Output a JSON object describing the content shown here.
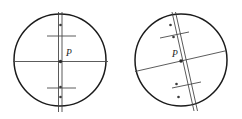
{
  "figure": {
    "kind": "reticle-comparison-diagram",
    "canvas": {
      "width": 242,
      "height": 119,
      "background": "#ffffff"
    },
    "colors": {
      "circle_stroke": "#1b1b1b",
      "reticle_stroke": "#4a4a4a",
      "tick_stroke": "#4a4a4a",
      "dot_fill": "#3a3a3a",
      "label_fill": "#1b1b1b"
    }
  },
  "panels": [
    {
      "id": "left-panel",
      "name": "aligned-reticle",
      "circle": {
        "cx": 60,
        "cy": 60,
        "r": 46
      },
      "rotation_deg": 0,
      "point": {
        "label": "P",
        "cx": 60.5,
        "cy": 61.5,
        "r": 1.7,
        "label_x": 66,
        "label_y": 56
      },
      "lines": [
        {
          "name": "horizontal-reticle-line",
          "x1": 13,
          "y1": 61.5,
          "x2": 108,
          "y2": 61.5
        },
        {
          "name": "vertical-reticle-line-a",
          "x1": 58.5,
          "y1": 12,
          "x2": 58.5,
          "y2": 112
        },
        {
          "name": "vertical-reticle-line-b",
          "x1": 62.0,
          "y1": 12,
          "x2": 62.0,
          "y2": 112
        }
      ],
      "ticks": [
        {
          "name": "upper-tick",
          "x1": 47,
          "y1": 36,
          "x2": 76,
          "y2": 36
        },
        {
          "name": "lower-tick",
          "x1": 47,
          "y1": 88,
          "x2": 76,
          "y2": 88
        }
      ],
      "dots": [
        {
          "name": "upper-dot",
          "cx": 60.5,
          "cy": 25,
          "r": 1.3
        },
        {
          "name": "lower-dot-inner",
          "cx": 60.5,
          "cy": 87,
          "r": 1.3
        },
        {
          "name": "lower-dot-outer",
          "cx": 60.5,
          "cy": 97,
          "r": 1.3
        }
      ]
    },
    {
      "id": "right-panel",
      "name": "rotated-reticle",
      "circle": {
        "cx": 181,
        "cy": 60,
        "r": 46
      },
      "rotation_deg": -13,
      "point": {
        "label": "P",
        "cx": 181.0,
        "cy": 61.0,
        "r": 1.7,
        "label_x": 172,
        "label_y": 57
      },
      "lines": [
        {
          "name": "horizontal-reticle-line",
          "x1": 135,
          "y1": 71.5,
          "x2": 227,
          "y2": 50.5
        },
        {
          "name": "vertical-reticle-line-a",
          "x1": 172,
          "y1": 12,
          "x2": 194,
          "y2": 111
        },
        {
          "name": "vertical-reticle-line-b",
          "x1": 175.5,
          "y1": 12,
          "x2": 197.5,
          "y2": 111
        }
      ],
      "ticks": [
        {
          "name": "upper-tick",
          "x1": 160,
          "y1": 38,
          "x2": 189,
          "y2": 32
        },
        {
          "name": "lower-tick",
          "x1": 172,
          "y1": 88,
          "x2": 201,
          "y2": 82
        }
      ],
      "dots": [
        {
          "name": "upper-dot-outer",
          "cx": 170.5,
          "cy": 25,
          "r": 1.3
        },
        {
          "name": "upper-dot-inner",
          "cx": 173.5,
          "cy": 37,
          "r": 1.3
        },
        {
          "name": "lower-dot-inner",
          "cx": 176.5,
          "cy": 84,
          "r": 1.3
        },
        {
          "name": "lower-dot-outer",
          "cx": 178.5,
          "cy": 97,
          "r": 1.3
        }
      ]
    }
  ]
}
